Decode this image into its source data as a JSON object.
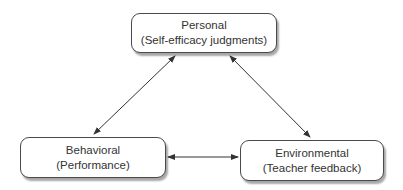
{
  "diagram": {
    "nodes": [
      {
        "id": "personal",
        "title": "Personal",
        "subtitle": "(Self-efficacy judgments)"
      },
      {
        "id": "behavioral",
        "title": "Behavioral",
        "subtitle": "(Performance)"
      },
      {
        "id": "environmental",
        "title": "Environmental",
        "subtitle": "(Teacher feedback)"
      }
    ],
    "edges": [
      {
        "from": "personal",
        "to": "behavioral",
        "type": "bidirectional"
      },
      {
        "from": "personal",
        "to": "environmental",
        "type": "bidirectional"
      },
      {
        "from": "behavioral",
        "to": "environmental",
        "type": "bidirectional"
      }
    ],
    "colors": {
      "border": "#4a4a4a",
      "arrow": "#333333",
      "text": "#333333"
    }
  }
}
